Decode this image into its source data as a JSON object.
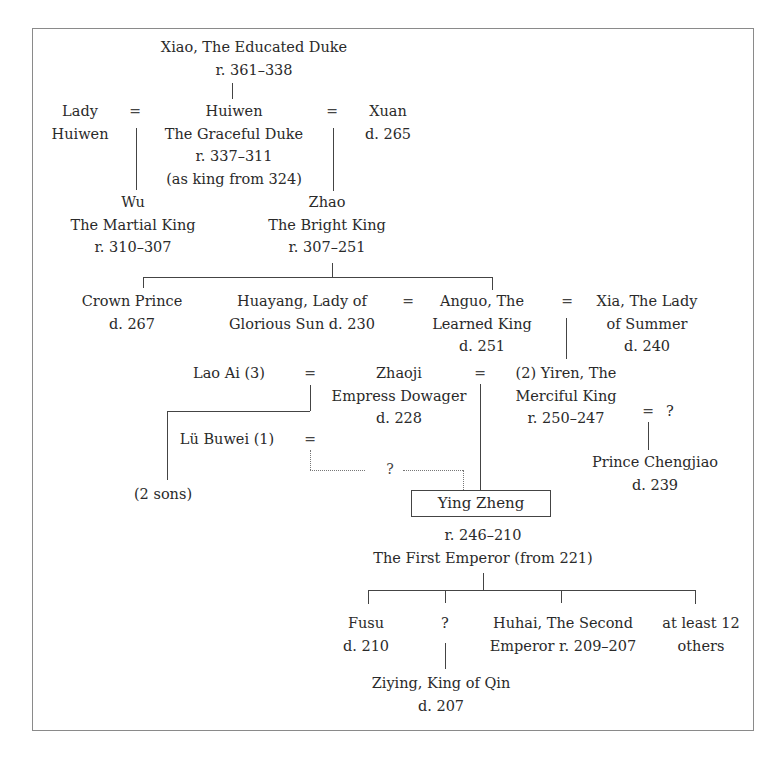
{
  "diagram": {
    "type": "family-tree",
    "nodes": {
      "xiao": {
        "lines": [
          "Xiao, The Educated Duke",
          "r. 361–338"
        ]
      },
      "lady_huiwen": {
        "lines": [
          "Lady",
          "Huiwen"
        ]
      },
      "huiwen": {
        "lines": [
          "Huiwen",
          "The Graceful Duke",
          "r. 337–311",
          "(as king from 324)"
        ]
      },
      "xuan": {
        "lines": [
          "Xuan",
          "d. 265"
        ]
      },
      "wu": {
        "lines": [
          "Wu",
          "The Martial King",
          "r. 310–307"
        ]
      },
      "zhao": {
        "lines": [
          "Zhao",
          "The Bright King",
          "r. 307–251"
        ]
      },
      "crown_prince": {
        "lines": [
          "Crown Prince",
          "d. 267"
        ]
      },
      "huayang": {
        "lines": [
          "Huayang, Lady of",
          "Glorious Sun d. 230"
        ]
      },
      "anguo": {
        "lines": [
          "Anguo, The",
          "Learned King",
          "d. 251"
        ]
      },
      "xia": {
        "lines": [
          "Xia, The Lady",
          "of Summer",
          "d. 240"
        ]
      },
      "lao_ai": {
        "lines": [
          "Lao Ai (3)"
        ]
      },
      "zhaoji": {
        "lines": [
          "Zhaoji",
          "Empress Dowager",
          "d. 228"
        ]
      },
      "yiren": {
        "lines": [
          "(2) Yiren, The",
          "Merciful King",
          "r. 250–247"
        ]
      },
      "yiren_spouse": {
        "lines": [
          "?"
        ]
      },
      "lu_buwei": {
        "lines": [
          "Lü Buwei (1)"
        ]
      },
      "two_sons": {
        "lines": [
          "(2 sons)"
        ]
      },
      "chengjiao": {
        "lines": [
          "Prince Chengjiao",
          "d. 239"
        ]
      },
      "ying_zheng": {
        "name": "Ying Zheng",
        "lines": [
          "r. 246–210",
          "The First Emperor (from 221)"
        ]
      },
      "fusu": {
        "lines": [
          "Fusu",
          "d. 210"
        ]
      },
      "unknown_son": {
        "lines": [
          "?"
        ]
      },
      "huhai": {
        "lines": [
          "Huhai, The Second",
          "Emperor r. 209–207"
        ]
      },
      "others": {
        "lines": [
          "at least 12",
          "others"
        ]
      },
      "ziying": {
        "lines": [
          "Ziying, King of Qin",
          "d. 207"
        ]
      }
    },
    "symbols": {
      "marriage": "=",
      "uncertain": "?"
    }
  }
}
